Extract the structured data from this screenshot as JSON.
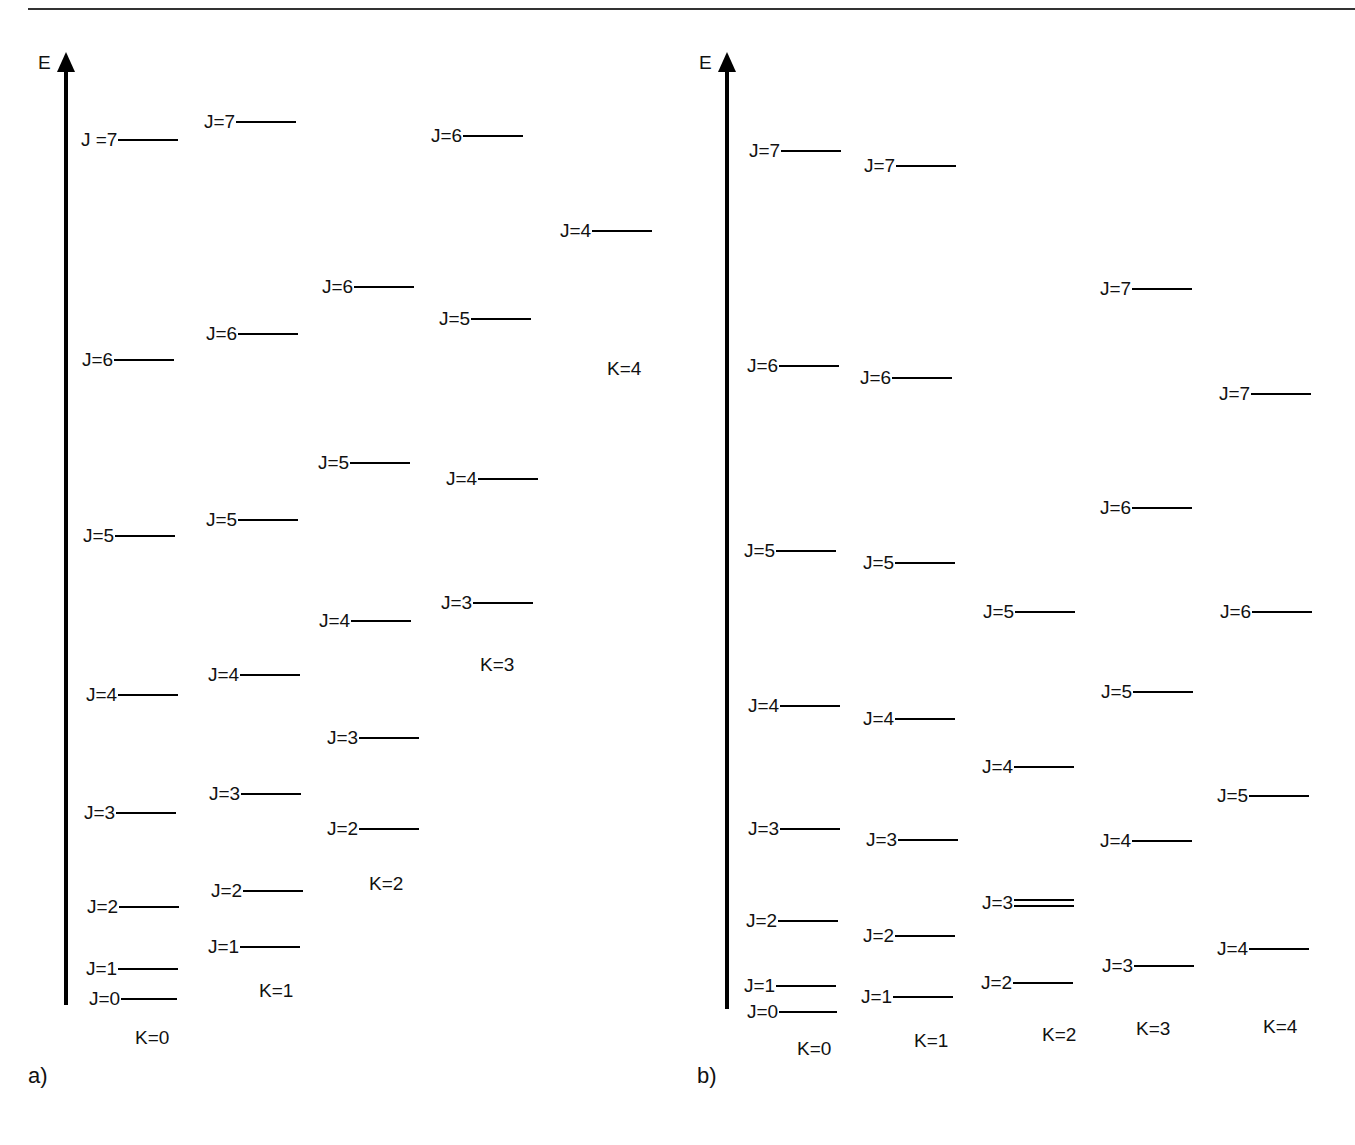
{
  "figure": {
    "axis_label": "E",
    "panels": [
      {
        "id": "a",
        "tag": "a)",
        "axis": {
          "x": 66,
          "top": 52,
          "bottom": 1005
        },
        "k_labels": [
          {
            "text": "K=0",
            "x": 135,
            "y": 1038
          },
          {
            "text": "K=1",
            "x": 259,
            "y": 991
          },
          {
            "text": "K=2",
            "x": 369,
            "y": 884
          },
          {
            "text": "K=3",
            "x": 480,
            "y": 665
          },
          {
            "text": "K=4",
            "x": 607,
            "y": 369
          }
        ],
        "levels": [
          {
            "k": 0,
            "label": "J=0",
            "x": 89,
            "y": 999,
            "bar": 56
          },
          {
            "k": 0,
            "label": "J=1",
            "x": 86,
            "y": 969,
            "bar": 60
          },
          {
            "k": 0,
            "label": "J=2",
            "x": 87,
            "y": 907,
            "bar": 60
          },
          {
            "k": 0,
            "label": "J=3",
            "x": 84,
            "y": 813,
            "bar": 60
          },
          {
            "k": 0,
            "label": "J=4",
            "x": 86,
            "y": 695,
            "bar": 60
          },
          {
            "k": 0,
            "label": "J=5",
            "x": 83,
            "y": 536,
            "bar": 60
          },
          {
            "k": 0,
            "label": "J=6",
            "x": 82,
            "y": 360,
            "bar": 60
          },
          {
            "k": 0,
            "label": "J =7",
            "x": 81,
            "y": 140,
            "bar": 60
          },
          {
            "k": 1,
            "label": "J=1",
            "x": 208,
            "y": 947,
            "bar": 60
          },
          {
            "k": 1,
            "label": "J=2",
            "x": 211,
            "y": 891,
            "bar": 60
          },
          {
            "k": 1,
            "label": "J=3",
            "x": 209,
            "y": 794,
            "bar": 60
          },
          {
            "k": 1,
            "label": "J=4",
            "x": 208,
            "y": 675,
            "bar": 60
          },
          {
            "k": 1,
            "label": "J=5",
            "x": 206,
            "y": 520,
            "bar": 60
          },
          {
            "k": 1,
            "label": "J=6",
            "x": 206,
            "y": 334,
            "bar": 60
          },
          {
            "k": 1,
            "label": "J=7",
            "x": 204,
            "y": 122,
            "bar": 60
          },
          {
            "k": 2,
            "label": "J=2",
            "x": 327,
            "y": 829,
            "bar": 60
          },
          {
            "k": 2,
            "label": "J=3",
            "x": 327,
            "y": 738,
            "bar": 60
          },
          {
            "k": 2,
            "label": "J=4",
            "x": 319,
            "y": 621,
            "bar": 60
          },
          {
            "k": 2,
            "label": "J=5",
            "x": 318,
            "y": 463,
            "bar": 60
          },
          {
            "k": 2,
            "label": "J=6",
            "x": 322,
            "y": 287,
            "bar": 60
          },
          {
            "k": 3,
            "label": "J=3",
            "x": 441,
            "y": 603,
            "bar": 60
          },
          {
            "k": 3,
            "label": "J=4",
            "x": 446,
            "y": 479,
            "bar": 60
          },
          {
            "k": 3,
            "label": "J=5",
            "x": 439,
            "y": 319,
            "bar": 60
          },
          {
            "k": 3,
            "label": "J=6",
            "x": 431,
            "y": 136,
            "bar": 60
          },
          {
            "k": 4,
            "label": "J=4",
            "x": 560,
            "y": 231,
            "bar": 60
          }
        ]
      },
      {
        "id": "b",
        "tag": "b)",
        "axis": {
          "x": 727,
          "top": 52,
          "bottom": 1009
        },
        "k_labels": [
          {
            "text": "K=0",
            "x": 797,
            "y": 1049
          },
          {
            "text": "K=1",
            "x": 914,
            "y": 1041
          },
          {
            "text": "K=2",
            "x": 1042,
            "y": 1035
          },
          {
            "text": "K=3",
            "x": 1136,
            "y": 1029
          },
          {
            "text": "K=4",
            "x": 1263,
            "y": 1027
          }
        ],
        "levels": [
          {
            "k": 0,
            "label": "J=0",
            "x": 747,
            "y": 1012,
            "bar": 58
          },
          {
            "k": 0,
            "label": "J=1",
            "x": 744,
            "y": 986,
            "bar": 60
          },
          {
            "k": 0,
            "label": "J=2",
            "x": 746,
            "y": 921,
            "bar": 60
          },
          {
            "k": 0,
            "label": "J=3",
            "x": 748,
            "y": 829,
            "bar": 60
          },
          {
            "k": 0,
            "label": "J=4",
            "x": 748,
            "y": 706,
            "bar": 60
          },
          {
            "k": 0,
            "label": "J=5",
            "x": 744,
            "y": 551,
            "bar": 60
          },
          {
            "k": 0,
            "label": "J=6",
            "x": 747,
            "y": 366,
            "bar": 60
          },
          {
            "k": 0,
            "label": "J=7",
            "x": 749,
            "y": 151,
            "bar": 60
          },
          {
            "k": 1,
            "label": "J=1",
            "x": 861,
            "y": 997,
            "bar": 60
          },
          {
            "k": 1,
            "label": "J=2",
            "x": 863,
            "y": 936,
            "bar": 60
          },
          {
            "k": 1,
            "label": "J=3",
            "x": 866,
            "y": 840,
            "bar": 60
          },
          {
            "k": 1,
            "label": "J=4",
            "x": 863,
            "y": 719,
            "bar": 60
          },
          {
            "k": 1,
            "label": "J=5",
            "x": 863,
            "y": 563,
            "bar": 60
          },
          {
            "k": 1,
            "label": "J=6",
            "x": 860,
            "y": 378,
            "bar": 60
          },
          {
            "k": 1,
            "label": "J=7",
            "x": 864,
            "y": 166,
            "bar": 60
          },
          {
            "k": 2,
            "label": "J=2",
            "x": 981,
            "y": 983,
            "bar": 60
          },
          {
            "k": 2,
            "label": "J=3",
            "x": 982,
            "y": 903,
            "bar": 60,
            "double": true
          },
          {
            "k": 2,
            "label": "J=4",
            "x": 982,
            "y": 767,
            "bar": 60
          },
          {
            "k": 2,
            "label": "J=5",
            "x": 983,
            "y": 612,
            "bar": 60
          },
          {
            "k": 3,
            "label": "J=3",
            "x": 1102,
            "y": 966,
            "bar": 60
          },
          {
            "k": 3,
            "label": "J=4",
            "x": 1100,
            "y": 841,
            "bar": 60
          },
          {
            "k": 3,
            "label": "J=5",
            "x": 1101,
            "y": 692,
            "bar": 60
          },
          {
            "k": 3,
            "label": "J=6",
            "x": 1100,
            "y": 508,
            "bar": 60
          },
          {
            "k": 3,
            "label": "J=7",
            "x": 1100,
            "y": 289,
            "bar": 60
          },
          {
            "k": 4,
            "label": "J=4",
            "x": 1217,
            "y": 949,
            "bar": 60
          },
          {
            "k": 4,
            "label": "J=5",
            "x": 1217,
            "y": 796,
            "bar": 60
          },
          {
            "k": 4,
            "label": "J=6",
            "x": 1220,
            "y": 612,
            "bar": 60
          },
          {
            "k": 4,
            "label": "J=7",
            "x": 1219,
            "y": 394,
            "bar": 60
          }
        ]
      }
    ],
    "panel_tags": [
      {
        "text": "a)",
        "x": 28,
        "y": 1076
      },
      {
        "text": "b)",
        "x": 697,
        "y": 1076
      }
    ]
  }
}
